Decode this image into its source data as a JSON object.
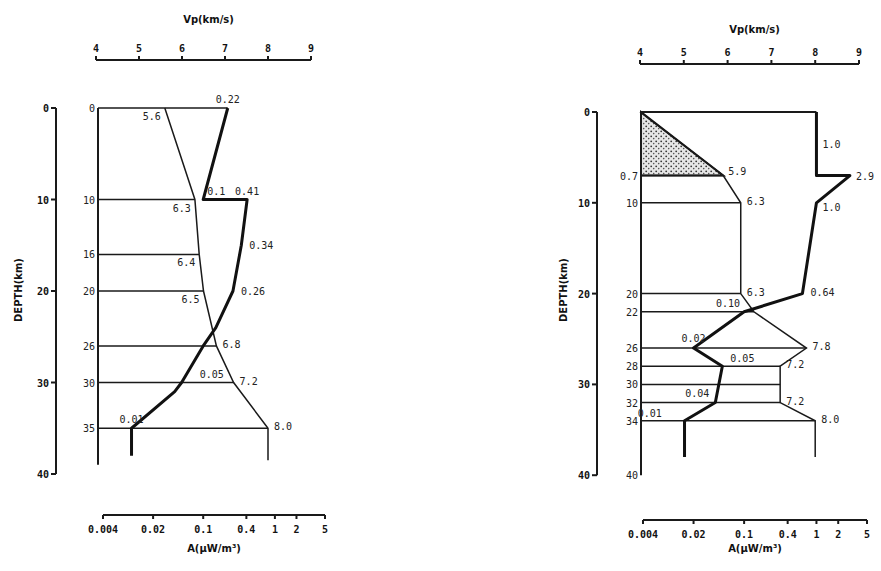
{
  "chart_data": [
    {
      "type": "line",
      "title": "",
      "vp_axis": {
        "label": "Vp(km/s)",
        "ticks": [
          "4",
          "5",
          "6",
          "7",
          "8",
          "9"
        ],
        "range": [
          4,
          9
        ]
      },
      "q_axis": {
        "label": "A(μW/m³)",
        "ticks": [
          "0.004",
          "0.02",
          "0.1",
          "0.4",
          "1",
          "2",
          "5"
        ],
        "tick_values": [
          0.004,
          0.02,
          0.1,
          0.4,
          1,
          2,
          5
        ],
        "scale": "log",
        "range": [
          0.004,
          5
        ]
      },
      "depth_axis": {
        "label": "DEPTH(km)",
        "ticks": [
          "0",
          "10",
          "20",
          "30",
          "40"
        ],
        "range": [
          0,
          40
        ]
      },
      "layer_boundaries": [
        {
          "depth": 0,
          "label": "0"
        },
        {
          "depth": 10,
          "label": "10"
        },
        {
          "depth": 16,
          "label": "16"
        },
        {
          "depth": 20,
          "label": "20"
        },
        {
          "depth": 26,
          "label": "26"
        },
        {
          "depth": 30,
          "label": "30"
        },
        {
          "depth": 35,
          "label": "35"
        }
      ],
      "vp_profile": {
        "name": "Vp",
        "points": [
          [
            5.6,
            0
          ],
          [
            6.3,
            10
          ],
          [
            6.4,
            16
          ],
          [
            6.5,
            20
          ],
          [
            6.8,
            26
          ],
          [
            7.2,
            30
          ],
          [
            8.0,
            35
          ],
          [
            8.0,
            38.5
          ]
        ],
        "labels": [
          {
            "text": "5.6",
            "vp": 5.6,
            "depth": 0
          },
          {
            "text": "6.3",
            "vp": 6.3,
            "depth": 10
          },
          {
            "text": "6.4",
            "vp": 6.4,
            "depth": 16
          },
          {
            "text": "6.5",
            "vp": 6.5,
            "depth": 20
          },
          {
            "text": "6.8",
            "vp": 6.8,
            "depth": 26
          },
          {
            "text": "7.2",
            "vp": 7.2,
            "depth": 30
          },
          {
            "text": "8.0",
            "vp": 8.0,
            "depth": 35
          }
        ]
      },
      "q_profile": {
        "name": "Heat production",
        "points": [
          [
            0.22,
            0
          ],
          [
            0.1,
            10
          ],
          [
            0.41,
            10
          ],
          [
            0.34,
            15
          ],
          [
            0.26,
            20
          ],
          [
            0.15,
            24
          ],
          [
            0.1,
            26
          ],
          [
            0.05,
            30
          ],
          [
            0.04,
            31
          ],
          [
            0.01,
            35
          ],
          [
            0.01,
            38
          ]
        ],
        "labels": [
          {
            "text": "0.22",
            "q": 0.22,
            "depth": 0
          },
          {
            "text": "0.1",
            "q": 0.1,
            "depth": 10
          },
          {
            "text": "0.41",
            "q": 0.41,
            "depth": 10
          },
          {
            "text": "0.34",
            "q": 0.34,
            "depth": 15
          },
          {
            "text": "0.26",
            "q": 0.26,
            "depth": 20
          },
          {
            "text": "0.05",
            "q": 0.05,
            "depth": 30
          },
          {
            "text": "0.01",
            "q": 0.01,
            "depth": 35
          }
        ]
      }
    },
    {
      "type": "line",
      "title": "",
      "vp_axis": {
        "label": "Vp(km/s)",
        "ticks": [
          "4",
          "5",
          "6",
          "7",
          "8",
          "9"
        ],
        "range": [
          4,
          9
        ]
      },
      "q_axis": {
        "label": "A(μW/m³)",
        "ticks": [
          "0.004",
          "0.02",
          "0.1",
          "0.4",
          "1",
          "2",
          "5"
        ],
        "tick_values": [
          0.004,
          0.02,
          0.1,
          0.4,
          1,
          2,
          5
        ],
        "scale": "log",
        "range": [
          0.004,
          5
        ]
      },
      "depth_axis": {
        "label": "DEPTH(km)",
        "ticks": [
          "0",
          "10",
          "20",
          "30",
          "40"
        ],
        "range": [
          0,
          40
        ]
      },
      "layer_boundaries": [
        {
          "depth": 0,
          "label": ""
        },
        {
          "depth": 7,
          "label": "0.7"
        },
        {
          "depth": 10,
          "label": "10"
        },
        {
          "depth": 20,
          "label": "20"
        },
        {
          "depth": 22,
          "label": "22"
        },
        {
          "depth": 26,
          "label": "26"
        },
        {
          "depth": 28,
          "label": "28"
        },
        {
          "depth": 30,
          "label": "30"
        },
        {
          "depth": 32,
          "label": "32"
        },
        {
          "depth": 34,
          "label": "34"
        },
        {
          "depth": 40,
          "label": "40"
        }
      ],
      "sediment_layer": {
        "top_depth": 0,
        "bottom_depth": 7,
        "fill": "stippled"
      },
      "vp_profile": {
        "name": "Vp",
        "points": [
          [
            4.0,
            0
          ],
          [
            5.9,
            7
          ],
          [
            6.3,
            10
          ],
          [
            6.3,
            20
          ],
          [
            6.6,
            22
          ],
          [
            7.8,
            26
          ],
          [
            7.2,
            28
          ],
          [
            7.2,
            32
          ],
          [
            8.0,
            34
          ],
          [
            8.0,
            38
          ]
        ],
        "labels": [
          {
            "text": "5.9",
            "vp": 5.9,
            "depth": 7
          },
          {
            "text": "6.3",
            "vp": 6.3,
            "depth": 10
          },
          {
            "text": "6.3",
            "vp": 6.3,
            "depth": 20
          },
          {
            "text": "7.8",
            "vp": 7.8,
            "depth": 26
          },
          {
            "text": "7.2",
            "vp": 7.2,
            "depth": 28
          },
          {
            "text": "7.2",
            "vp": 7.2,
            "depth": 32
          },
          {
            "text": "8.0",
            "vp": 8.0,
            "depth": 34
          }
        ]
      },
      "q_profile": {
        "name": "Heat production",
        "points": [
          [
            1.0,
            0
          ],
          [
            1.0,
            7
          ],
          [
            2.9,
            7
          ],
          [
            1.0,
            10
          ],
          [
            0.64,
            20
          ],
          [
            0.1,
            22
          ],
          [
            0.02,
            26
          ],
          [
            0.05,
            28
          ],
          [
            0.04,
            32
          ],
          [
            0.015,
            34
          ],
          [
            0.015,
            38
          ]
        ],
        "labels": [
          {
            "text": "1.0",
            "q": 1.0,
            "depth": 3.5
          },
          {
            "text": "2.9",
            "q": 2.9,
            "depth": 7
          },
          {
            "text": "1.0",
            "q": 1.0,
            "depth": 10
          },
          {
            "text": "0.64",
            "q": 0.64,
            "depth": 20
          },
          {
            "text": "0.10",
            "q": 0.1,
            "depth": 22
          },
          {
            "text": "0.02",
            "q": 0.02,
            "depth": 26
          },
          {
            "text": "0.05",
            "q": 0.05,
            "depth": 28
          },
          {
            "text": "0.04",
            "q": 0.04,
            "depth": 32
          },
          {
            "text": "0.01",
            "q": 0.01,
            "depth": 34
          }
        ]
      }
    }
  ]
}
